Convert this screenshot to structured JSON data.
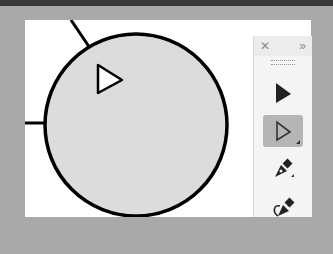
{
  "app": {
    "title": ""
  },
  "canvas": {
    "shape": "circle",
    "fill": "#d9d9d9",
    "stroke": "#000000"
  },
  "toolbar": {
    "close_label": "✕",
    "expand_label": "»",
    "tools": [
      {
        "name": "selection-tool",
        "active": false
      },
      {
        "name": "direct-selection-tool",
        "active": true
      },
      {
        "name": "pen-tool",
        "active": false
      },
      {
        "name": "curvature-tool",
        "active": false
      }
    ]
  }
}
